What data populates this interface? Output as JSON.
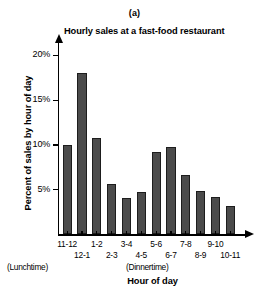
{
  "panel": {
    "label": "(a)"
  },
  "chart_data": {
    "type": "bar",
    "title": "Hourly sales at a fast-food restaurant",
    "xlabel": "Hour of day",
    "ylabel": "Percent of sales by hour of day",
    "categories": [
      "11-12",
      "12-1",
      "1-2",
      "2-3",
      "3-4",
      "4-5",
      "5-6",
      "6-7",
      "7-8",
      "8-9",
      "9-10",
      "10-11"
    ],
    "values": [
      10.0,
      18.0,
      10.8,
      5.6,
      4.1,
      4.8,
      9.2,
      9.8,
      6.6,
      4.9,
      4.2,
      3.2
    ],
    "ylim": [
      0,
      21.5
    ],
    "yticks": [
      5,
      10,
      15,
      20
    ],
    "ytick_labels": [
      "5%",
      "10%",
      "15%",
      "20%"
    ],
    "xtick_labels_top": [
      "11-12",
      "1-2",
      "3-4",
      "5-6",
      "7-8",
      "9-10"
    ],
    "xtick_labels_bottom": [
      "12-1",
      "2-3",
      "4-5",
      "6-7",
      "8-9",
      "10-11"
    ],
    "annotations": [
      "(Lunchtime)",
      "(Dinnertime)"
    ],
    "grid": false,
    "legend": "none",
    "bar_color": "#4b4b4b",
    "bar_edge_color": "#1d1d1d",
    "axis_color": "#000000"
  },
  "annotations": {
    "lunchtime": "(Lunchtime)",
    "dinnertime": "(Dinnertime)"
  }
}
